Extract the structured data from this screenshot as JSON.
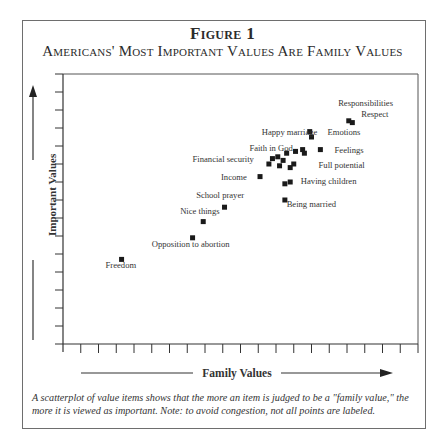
{
  "figure": {
    "label": "Figure 1",
    "title": "Americans' Most Important Values Are Family Values",
    "caption": "A scatterplot of value items shows that the more an item is judged to be a \"family value,\" the more it is viewed as important. Note: to avoid congestion, not all points are labeled."
  },
  "chart_data": {
    "type": "scatter",
    "title": "Americans' Most Important Values Are Family Values",
    "xlabel": "Family Values",
    "ylabel": "Important Values",
    "xlim": [
      0,
      20
    ],
    "ylim": [
      0,
      15
    ],
    "x_ticks": 20,
    "y_ticks": 15,
    "tick_labels": false,
    "grid": false,
    "legend": "none",
    "points": [
      {
        "label": "Freedom",
        "x": 3.3,
        "y": 4.7
      },
      {
        "label": "Opposition to abortion",
        "x": 7.3,
        "y": 5.9
      },
      {
        "label": "Nice things",
        "x": 7.9,
        "y": 6.8
      },
      {
        "label": "School prayer",
        "x": 9.1,
        "y": 7.6
      },
      {
        "label": "Income",
        "x": 11.1,
        "y": 9.3
      },
      {
        "label": "Being married",
        "x": 12.5,
        "y": 8.0
      },
      {
        "label": "Having children",
        "x": 12.5,
        "y": 8.9
      },
      {
        "label": "",
        "x": 12.8,
        "y": 9.0
      },
      {
        "label": "Financial security",
        "x": 11.6,
        "y": 10.0
      },
      {
        "label": "",
        "x": 11.8,
        "y": 10.3
      },
      {
        "label": "",
        "x": 12.1,
        "y": 10.4
      },
      {
        "label": "",
        "x": 12.4,
        "y": 10.2
      },
      {
        "label": "",
        "x": 12.2,
        "y": 9.9
      },
      {
        "label": "Full potential",
        "x": 12.8,
        "y": 9.8
      },
      {
        "label": "",
        "x": 13.0,
        "y": 10.0
      },
      {
        "label": "Faith in God",
        "x": 12.6,
        "y": 10.6
      },
      {
        "label": "",
        "x": 13.1,
        "y": 10.7
      },
      {
        "label": "",
        "x": 13.5,
        "y": 10.8
      },
      {
        "label": "",
        "x": 13.6,
        "y": 10.6
      },
      {
        "label": "Feelings",
        "x": 14.5,
        "y": 10.8
      },
      {
        "label": "Happy marriage",
        "x": 13.9,
        "y": 11.8
      },
      {
        "label": "Emotions",
        "x": 14.0,
        "y": 11.5
      },
      {
        "label": "Respect",
        "x": 16.1,
        "y": 12.4
      },
      {
        "label": "Responsibilities",
        "x": 16.3,
        "y": 12.3
      }
    ],
    "annotations": [
      {
        "text": "Responsibilities",
        "x": 15.5,
        "y": 13.2
      },
      {
        "text": "Respect",
        "x": 16.8,
        "y": 12.6
      },
      {
        "text": "Emotions",
        "x": 14.9,
        "y": 11.6
      },
      {
        "text": "Happy marriage",
        "x": 11.2,
        "y": 11.6
      },
      {
        "text": "Faith in God",
        "x": 10.5,
        "y": 10.7
      },
      {
        "text": "Feelings",
        "x": 15.3,
        "y": 10.6
      },
      {
        "text": "Financial security",
        "x": 7.3,
        "y": 10.1
      },
      {
        "text": "Full potential",
        "x": 14.4,
        "y": 9.8
      },
      {
        "text": "Income",
        "x": 8.9,
        "y": 9.1
      },
      {
        "text": "Having children",
        "x": 13.4,
        "y": 8.9
      },
      {
        "text": "School prayer",
        "x": 7.5,
        "y": 8.1
      },
      {
        "text": "Being married",
        "x": 12.6,
        "y": 7.6
      },
      {
        "text": "Nice things",
        "x": 6.6,
        "y": 7.2
      },
      {
        "text": "Opposition to abortion",
        "x": 5.0,
        "y": 5.4
      },
      {
        "text": "Freedom",
        "x": 2.4,
        "y": 4.2
      }
    ]
  }
}
